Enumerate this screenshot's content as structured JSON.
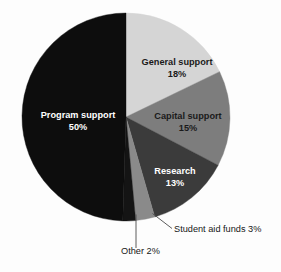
{
  "chart_data": {
    "type": "pie",
    "title": "",
    "subtitle": "",
    "xlabel": "",
    "ylabel": "",
    "legend_position": "none",
    "grid": false,
    "start_angle_deg": 0,
    "direction": "clockwise",
    "categories": [
      "General support",
      "Capital support",
      "Research",
      "Student aid funds",
      "Other",
      "Program support"
    ],
    "values": [
      18,
      15,
      13,
      3,
      2,
      50
    ],
    "value_unit": "%",
    "colors": [
      "#d5d5d5",
      "#7d7d7d",
      "#3b3b3b",
      "#8a8a8a",
      "#141414",
      "#0d0d0d"
    ],
    "slices": [
      {
        "label": "General support",
        "value": 18,
        "value_text": "18%",
        "color": "#d5d5d5",
        "label_placement": "inside",
        "text_tone": "on-light"
      },
      {
        "label": "Capital support",
        "value": 15,
        "value_text": "15%",
        "color": "#7d7d7d",
        "label_placement": "inside",
        "text_tone": "on-light"
      },
      {
        "label": "Research",
        "value": 13,
        "value_text": "13%",
        "color": "#3b3b3b",
        "label_placement": "inside",
        "text_tone": "on-dark"
      },
      {
        "label": "Student aid funds",
        "value": 3,
        "value_text": "3%",
        "color": "#8a8a8a",
        "label_placement": "outside",
        "text_tone": "on-light"
      },
      {
        "label": "Other",
        "value": 2,
        "value_text": "2%",
        "color": "#141414",
        "label_placement": "outside",
        "text_tone": "on-light"
      },
      {
        "label": "Program support",
        "value": 50,
        "value_text": "50%",
        "color": "#0d0d0d",
        "label_placement": "inside",
        "text_tone": "on-dark"
      }
    ],
    "inside_labels": [
      {
        "name": "General support",
        "pct": "18%"
      },
      {
        "name": "Capital support",
        "pct": "15%"
      },
      {
        "name": "Research",
        "pct": "13%"
      },
      {
        "name": "Program support",
        "pct": "50%"
      }
    ],
    "outside_labels": [
      {
        "text": "Student aid funds 3%"
      },
      {
        "text": "Other 2%"
      }
    ]
  }
}
